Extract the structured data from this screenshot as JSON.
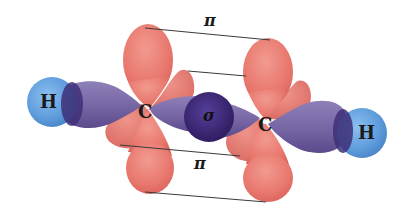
{
  "figure": {
    "atoms": [
      {
        "id": "H1",
        "label": "H"
      },
      {
        "id": "C1",
        "label": "C"
      },
      {
        "id": "C2",
        "label": "C"
      },
      {
        "id": "H2",
        "label": "H"
      }
    ],
    "bonds": {
      "sigma_label": "σ",
      "pi_top_label": "π",
      "pi_bottom_label": "π"
    },
    "colors": {
      "hydrogen": "#6aa6e0",
      "hydrogen_edge": "#4a86c8",
      "sp_lobe": "#7a6aa8",
      "sp_lobe_dark": "#3d2c72",
      "sigma_center": "#3b2470",
      "p_orbital": "#e8736a",
      "p_orbital_light": "#f09088",
      "line": "#3a3a3a",
      "background": "#ffffff"
    }
  }
}
